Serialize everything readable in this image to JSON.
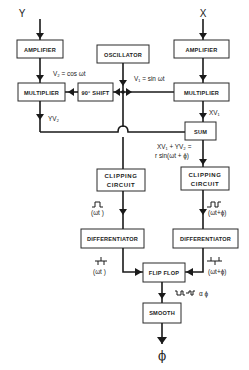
{
  "inputs": {
    "y": "Y",
    "x": "X"
  },
  "output": {
    "phi": "ϕ"
  },
  "blocks": {
    "amp_left": "AMPLIFIER",
    "amp_right": "AMPLIFIER",
    "oscillator": "OSCILLATOR",
    "mult_left": "MULTIPLIER",
    "mult_right": "MULTIPLIER",
    "shift": "90° SHIFT",
    "sum": "SUM",
    "clip_left_1": "CLIPPING",
    "clip_left_2": "CIRCUIT",
    "clip_right_1": "CLIPPING",
    "clip_right_2": "CIRCUIT",
    "diff_left": "DIFFERENTIATOR",
    "diff_right": "DIFFERENTIATOR",
    "flipflop": "FLIP FLOP",
    "smooth": "SMOOTH"
  },
  "annotations": {
    "v2": "V₂ = cos ωt",
    "v1": "V₁ = sin ωt",
    "yv2": "YV₂",
    "xv1": "XV₁",
    "sum_eq_1": "XV₁ + YV₂ =",
    "sum_eq_2": "r sin(ωt + ϕ)",
    "wt_clip": "(ωt )",
    "wtphi_clip": "(ωt+ϕ)",
    "wt_diff": "(ωt )",
    "wtphi_diff": "(ωt+ϕ)",
    "prop_phi": "α ϕ"
  }
}
